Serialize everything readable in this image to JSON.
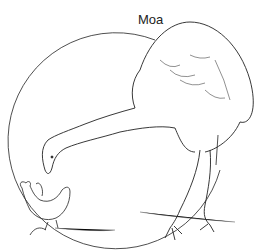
{
  "illustration": {
    "title": "Moa",
    "subjects": [
      "moa",
      "chicken"
    ],
    "colors": {
      "ink": "#222222",
      "background": "#ffffff"
    }
  }
}
